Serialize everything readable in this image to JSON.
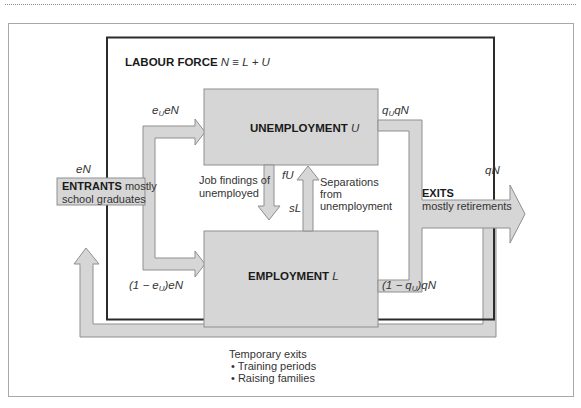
{
  "diagram": {
    "title_bold": "LABOUR FORCE",
    "title_formula": "N ≡ L + U",
    "boxes": {
      "unemployment": {
        "label": "UNEMPLOYMENT",
        "symbol": "U"
      },
      "employment": {
        "label": "EMPLOYMENT",
        "symbol": "L"
      },
      "entrants": {
        "label_bold": "ENTRANTS",
        "label_rest_1": "mostly",
        "label_rest_2": "school graduates"
      },
      "exits": {
        "label_bold": "EXITS",
        "label_rest": "mostly retirements"
      }
    },
    "flows": {
      "entrants_in": "eN",
      "to_unemployment_pre": "e",
      "to_unemployment_sub": "U",
      "to_unemployment_post": "eN",
      "to_employment_pre": "(1 − e",
      "to_employment_sub": "U",
      "to_employment_post": ")eN",
      "from_unemployment_pre": "q",
      "from_unemployment_sub": "U",
      "from_unemployment_post": "qN",
      "from_employment_pre": "(1 − q",
      "from_employment_sub": "U",
      "from_employment_post": ")qN",
      "exits_out": "qN",
      "job_findings_rate": "fU",
      "separations_rate": "sL"
    },
    "annotations": {
      "job_findings_1": "Job findings of",
      "job_findings_2": "unemployed",
      "separations_1": "Separations",
      "separations_2": "from",
      "separations_3": "unemployment"
    },
    "temporary_exits": {
      "title": "Temporary exits",
      "items": [
        "• Training periods",
        "• Raising families"
      ]
    }
  },
  "colors": {
    "box_fill": "#d6d6d6",
    "box_stroke": "#8f8f8f",
    "labour_force_border": "#2b2b2b",
    "outer_frame": "#a8a8a8"
  }
}
